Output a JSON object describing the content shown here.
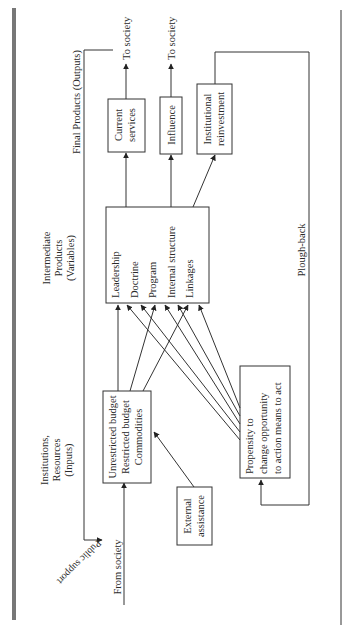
{
  "diagram": {
    "sections": {
      "inputs": "Institutions,|Resources|(Inputs)",
      "intermediate": "Intermediate|Products|(Variables)",
      "outputs": "Final Products (Outputs)"
    },
    "boxes": {
      "inputs": [
        "Unrestricted budget",
        "Restricted budget",
        "Commodities"
      ],
      "intermediate": [
        "Leadership",
        "Doctrine",
        "Program",
        "Internal structure",
        "Linkages"
      ],
      "current_services": [
        "Current",
        "services"
      ],
      "influence": [
        "Influence"
      ],
      "reinvestment": [
        "Institutional",
        "reinvestment"
      ],
      "external": [
        "External",
        "assistance"
      ],
      "propensity": [
        "Propensity to",
        "change opportunity",
        "to action means to act"
      ]
    },
    "labels": {
      "to_society_1": "To society",
      "to_society_2": "To society",
      "from_society": "From society",
      "public_support": "Public support",
      "plough_back": "Plough-back"
    }
  }
}
